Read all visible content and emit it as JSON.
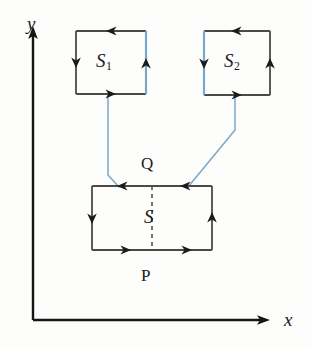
{
  "figure": {
    "axes": {
      "y_label": "y",
      "x_label": "x",
      "origin": {
        "x": 33,
        "y": 320
      },
      "y_tip": {
        "x": 33,
        "y": 30
      },
      "x_tip": {
        "x": 270,
        "y": 320
      }
    },
    "colors": {
      "stroke_dark": "#3b3b3b",
      "stroke_blue": "#7aa8cc",
      "text": "#1a1a1a",
      "background": "#fdfdfc"
    },
    "regions": [
      {
        "id": "s1",
        "label": "S",
        "subscript": "1",
        "shape": "square",
        "bounds": {
          "x": 76,
          "y": 31,
          "width": 70,
          "height": 63
        },
        "highlight_edge": "right",
        "highlight_color": "#7aa8cc",
        "orientation": "counterclockwise",
        "arrows": [
          "top-leftward",
          "left-downward",
          "bottom-rightward",
          "right-upward"
        ]
      },
      {
        "id": "s2",
        "label": "S",
        "subscript": "2",
        "shape": "square",
        "bounds": {
          "x": 204,
          "y": 31,
          "width": 66,
          "height": 64
        },
        "highlight_edge": "left",
        "highlight_color": "#7aa8cc",
        "orientation": "counterclockwise",
        "arrows": [
          "top-leftward",
          "left-downward",
          "bottom-rightward",
          "right-upward"
        ]
      },
      {
        "id": "s",
        "label": "S",
        "subscript": "",
        "shape": "rectangle",
        "bounds": {
          "x": 92,
          "y": 186,
          "width": 120,
          "height": 64
        },
        "highlight_edge": "none",
        "orientation": "counterclockwise",
        "arrows": [
          "top-left-leftward",
          "top-right-leftward",
          "left-downward",
          "bottom-left-rightward",
          "bottom-right-rightward",
          "right-upward"
        ],
        "divider": {
          "type": "dashed",
          "axis": "vertical",
          "x": 152
        }
      }
    ],
    "point_labels": [
      {
        "id": "q",
        "text": "Q",
        "x": 141,
        "y": 155
      },
      {
        "id": "p",
        "text": "P",
        "x": 141,
        "y": 267
      }
    ],
    "connectors": [
      {
        "id": "connector-left",
        "from": "s1-bottom",
        "to": "s-top-left",
        "color": "#7aa8cc",
        "points": "108,94 108,175 119,187"
      },
      {
        "id": "connector-right",
        "from": "s2-bottom",
        "to": "s-top-right",
        "color": "#7aa8cc",
        "points": "235,95 235,130 188,187"
      }
    ]
  }
}
